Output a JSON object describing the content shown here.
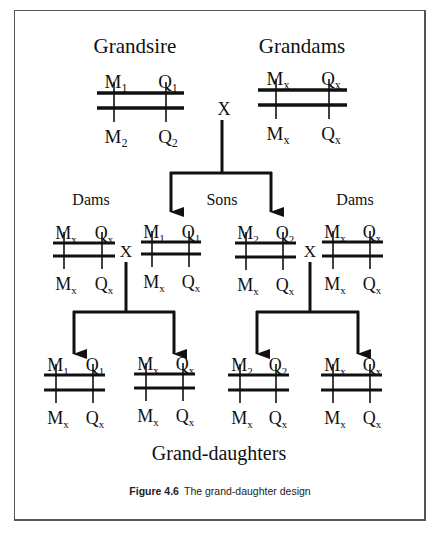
{
  "figure": {
    "caption_label": "Figure 4.6",
    "caption_text": "The grand-daughter design",
    "bottom_label": "Grand-daughters"
  },
  "colors": {
    "ink": "#111111",
    "frame": "#555555"
  },
  "generations": {
    "grandparents": {
      "cross_symbol": "X",
      "grandsire": {
        "label": "Grandsire",
        "chromosome": {
          "top": [
            [
              "M",
              "1"
            ],
            [
              "Q",
              "1"
            ]
          ],
          "bottom": [
            [
              "M",
              "2"
            ],
            [
              "Q",
              "2"
            ]
          ]
        }
      },
      "grandams": {
        "label": "Grandams",
        "chromosome": {
          "top": [
            [
              "M",
              "x"
            ],
            [
              "Q",
              "x"
            ]
          ],
          "bottom": [
            [
              "M",
              "x"
            ],
            [
              "Q",
              "x"
            ]
          ]
        }
      }
    },
    "parents": {
      "sons_label": "Sons",
      "dams_label": "Dams",
      "cross_symbol": "X",
      "left_dam": {
        "top": [
          [
            "M",
            "x"
          ],
          [
            "Q",
            "x"
          ]
        ],
        "bottom": [
          [
            "M",
            "x"
          ],
          [
            "Q",
            "x"
          ]
        ]
      },
      "son_1": {
        "top": [
          [
            "M",
            "1"
          ],
          [
            "Q",
            "1"
          ]
        ],
        "bottom": [
          [
            "M",
            "x"
          ],
          [
            "Q",
            "x"
          ]
        ]
      },
      "son_2": {
        "top": [
          [
            "M",
            "2"
          ],
          [
            "Q",
            "2"
          ]
        ],
        "bottom": [
          [
            "M",
            "x"
          ],
          [
            "Q",
            "x"
          ]
        ]
      },
      "right_dam": {
        "top": [
          [
            "M",
            "x"
          ],
          [
            "Q",
            "x"
          ]
        ],
        "bottom": [
          [
            "M",
            "x"
          ],
          [
            "Q",
            "x"
          ]
        ]
      }
    },
    "grand_daughters": [
      {
        "top": [
          [
            "M",
            "1"
          ],
          [
            "Q",
            "1"
          ]
        ],
        "bottom": [
          [
            "M",
            "x"
          ],
          [
            "Q",
            "x"
          ]
        ]
      },
      {
        "top": [
          [
            "M",
            "x"
          ],
          [
            "Q",
            "x"
          ]
        ],
        "bottom": [
          [
            "M",
            "x"
          ],
          [
            "Q",
            "x"
          ]
        ]
      },
      {
        "top": [
          [
            "M",
            "2"
          ],
          [
            "Q",
            "2"
          ]
        ],
        "bottom": [
          [
            "M",
            "x"
          ],
          [
            "Q",
            "x"
          ]
        ]
      },
      {
        "top": [
          [
            "M",
            "x"
          ],
          [
            "Q",
            "x"
          ]
        ],
        "bottom": [
          [
            "M",
            "x"
          ],
          [
            "Q",
            "x"
          ]
        ]
      }
    ]
  }
}
